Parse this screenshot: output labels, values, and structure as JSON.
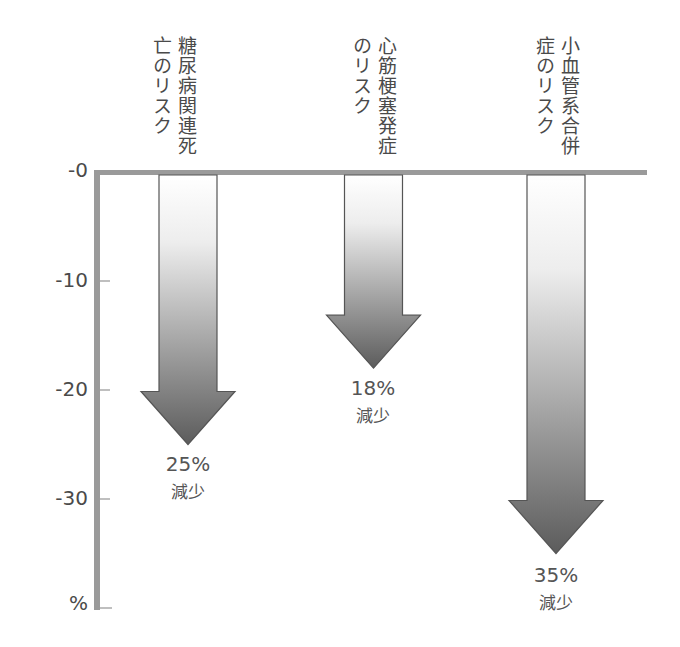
{
  "chart_data": {
    "type": "bar",
    "style": "downward arrows from zero baseline",
    "title": "",
    "xlabel": "",
    "ylabel": "%",
    "ylim": [
      -38,
      0
    ],
    "yticks": [
      "-0",
      "-10",
      "-20",
      "-30"
    ],
    "y_unit_label": "%",
    "grid": false,
    "categories": [
      [
        "糖尿病関連死",
        "亡のリスク"
      ],
      [
        "心筋梗塞発症",
        "のリスク"
      ],
      [
        "小血管系合併",
        "症のリスク"
      ]
    ],
    "categories_flat": [
      "糖尿病関連死亡のリスク",
      "心筋梗塞発症のリスク",
      "小血管系合併症のリスク"
    ],
    "values": [
      -25,
      -18,
      -35
    ],
    "annotations": [
      {
        "pct": "25%",
        "text": "減少"
      },
      {
        "pct": "18%",
        "text": "減少"
      },
      {
        "pct": "35%",
        "text": "減少"
      }
    ],
    "colors": {
      "axis": "#9a9a9a",
      "arrow_top": "#ffffff",
      "arrow_bottom": "#5a5a5a",
      "arrow_outline": "#555555",
      "text": "#4a4a4a"
    }
  }
}
